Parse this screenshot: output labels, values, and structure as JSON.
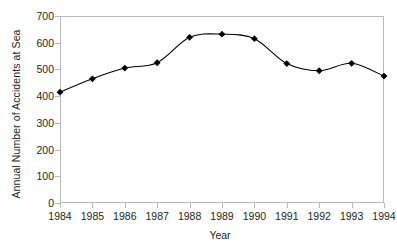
{
  "chart_data": {
    "type": "line",
    "title": "",
    "xlabel": "Year",
    "ylabel": "Annual Number of Accidents at Sea",
    "categories": [
      "1984",
      "1985",
      "1986",
      "1987",
      "1988",
      "1989",
      "1990",
      "1991",
      "1992",
      "1993",
      "1994"
    ],
    "x": [
      1984,
      1985,
      1986,
      1987,
      1988,
      1989,
      1990,
      1991,
      1992,
      1993,
      1994
    ],
    "values": [
      415,
      465,
      505,
      525,
      620,
      632,
      615,
      522,
      495,
      523,
      475
    ],
    "series": [
      {
        "name": "Annual Number of Accidents at Sea",
        "values": [
          415,
          465,
          505,
          525,
          620,
          632,
          615,
          522,
          495,
          523,
          475
        ]
      }
    ],
    "ylim": [
      0,
      700
    ],
    "ytick_labels": [
      "0",
      "100",
      "200",
      "300",
      "400",
      "500",
      "600",
      "700"
    ],
    "ytick_values": [
      0,
      100,
      200,
      300,
      400,
      500,
      600,
      700
    ],
    "xlim": [
      1984,
      1994
    ],
    "grid": false,
    "legend": false,
    "marker": "diamond",
    "marker_color": "#000000",
    "line_color": "#000000",
    "smoothing": "spline",
    "frame_color": "#b9b9b9"
  },
  "axes": {
    "y_title": "Annual Number of Accidents at Sea",
    "x_title": "Year"
  }
}
